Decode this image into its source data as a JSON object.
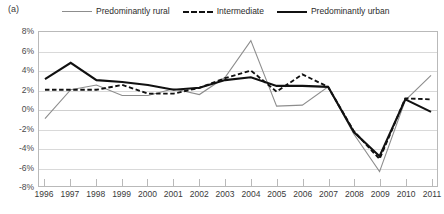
{
  "panel": {
    "label": "(a)"
  },
  "legend": {
    "position": "top",
    "entries": [
      {
        "name": "Predominantly rural",
        "style": "solid-thin",
        "color": "#8d8d8d",
        "swatch_icon": "line-swatch-icon"
      },
      {
        "name": "Intermediate",
        "style": "dashed",
        "color": "#111111",
        "swatch_icon": "dashed-line-swatch-icon"
      },
      {
        "name": "Predominantly urban",
        "style": "solid-thick",
        "color": "#111111",
        "swatch_icon": "line-swatch-icon"
      }
    ]
  },
  "axes": {
    "y_ticks": [
      "8%",
      "6%",
      "4%",
      "2%",
      "0%",
      "-2%",
      "-4%",
      "-6%",
      "-8%"
    ],
    "x_ticks": [
      "1996",
      "1997",
      "1998",
      "1999",
      "2000",
      "2001",
      "2002",
      "2003",
      "2004",
      "2005",
      "2006",
      "2007",
      "2008",
      "2009",
      "2010",
      "2011"
    ]
  },
  "chart_data": {
    "type": "line",
    "title": "",
    "subtitle": "",
    "xlabel": "",
    "ylabel": "",
    "ylim": [
      -8,
      8
    ],
    "ytick_step": 2,
    "grid": true,
    "legend_position": "top",
    "value_format": "percent",
    "categories": [
      "1996",
      "1997",
      "1998",
      "1999",
      "2000",
      "2001",
      "2002",
      "2003",
      "2004",
      "2005",
      "2006",
      "2007",
      "2008",
      "2009",
      "2010",
      "2011"
    ],
    "series": [
      {
        "name": "Predominantly rural",
        "color": "#8d8d8d",
        "style": "solid-thin",
        "values": [
          -1.0,
          2.0,
          2.5,
          1.4,
          1.4,
          2.1,
          1.5,
          3.3,
          7.1,
          0.3,
          0.4,
          2.3,
          -2.6,
          -6.5,
          0.9,
          3.5
        ]
      },
      {
        "name": "Intermediate",
        "color": "#111111",
        "style": "dashed",
        "values": [
          2.0,
          2.0,
          2.0,
          2.5,
          1.6,
          1.6,
          2.2,
          3.2,
          4.0,
          1.8,
          3.6,
          2.3,
          -2.3,
          -5.2,
          1.1,
          1.0
        ]
      },
      {
        "name": "Predominantly urban",
        "color": "#111111",
        "style": "solid-thick",
        "values": [
          3.1,
          4.8,
          3.0,
          2.8,
          2.5,
          2.0,
          2.2,
          3.0,
          3.3,
          2.4,
          2.4,
          2.3,
          -2.4,
          -4.9,
          1.0,
          -0.3
        ]
      }
    ]
  }
}
